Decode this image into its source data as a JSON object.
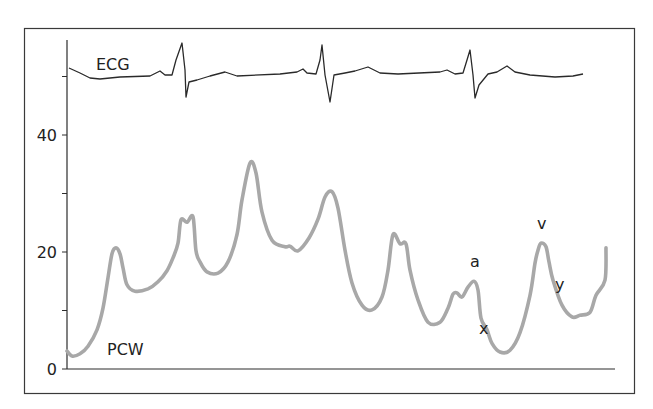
{
  "chart_data": {
    "type": "line",
    "title": "",
    "xlabel": "",
    "ylabel": "",
    "x_unit": "time sample index (no x-axis labels shown)",
    "ylim": [
      0,
      50
    ],
    "y_ticks": [
      {
        "value": 0,
        "label": "0"
      },
      {
        "value": 10,
        "label": ""
      },
      {
        "value": 20,
        "label": "20"
      },
      {
        "value": 30,
        "label": ""
      },
      {
        "value": 40,
        "label": "40"
      },
      {
        "value": 50,
        "label": ""
      }
    ],
    "grid": false,
    "legend": "none",
    "series": [
      {
        "name": "PCW",
        "label": "PCW",
        "color": "#a8a8a8",
        "x": [
          0,
          5,
          13,
          21,
          30,
          36,
          41,
          45,
          49,
          53,
          56,
          60,
          68,
          81,
          91,
          100,
          106,
          111,
          114,
          120,
          126,
          129,
          133,
          140,
          151,
          161,
          170,
          175,
          183,
          189,
          195,
          205,
          218,
          223,
          231,
          242,
          251,
          258,
          265,
          271,
          278,
          285,
          295,
          305,
          315,
          321,
          326,
          333,
          339,
          343,
          351,
          361,
          373,
          381,
          386,
          390,
          395,
          401,
          407,
          411,
          414,
          420,
          425,
          433,
          443,
          453,
          463,
          468,
          471,
          474,
          479,
          482,
          486,
          495,
          505,
          513,
          523,
          529,
          538,
          539
        ],
        "values": [
          3.1,
          2.2,
          2.6,
          3.9,
          6.7,
          10.4,
          15.6,
          19.7,
          20.7,
          19.7,
          17.3,
          14.4,
          13.3,
          13.7,
          14.9,
          16.8,
          19.0,
          21.5,
          25.5,
          25.1,
          26.0,
          20.2,
          18.3,
          16.6,
          16.4,
          18.3,
          23.0,
          28.9,
          35.2,
          33.5,
          26.8,
          22.0,
          20.9,
          21.0,
          20.2,
          22.4,
          25.6,
          29.4,
          30.3,
          27.5,
          20.3,
          14.7,
          10.9,
          10.1,
          12.3,
          16.9,
          23.0,
          21.4,
          21.4,
          16.9,
          11.8,
          8.0,
          8.0,
          10.4,
          12.8,
          13.0,
          12.3,
          14.0,
          15.0,
          13.5,
          8.7,
          6.7,
          4.4,
          2.9,
          3.2,
          6.2,
          12.6,
          18.1,
          20.3,
          21.5,
          20.9,
          18.3,
          15.2,
          10.9,
          8.9,
          9.2,
          9.7,
          12.6,
          15.2,
          20.7
        ]
      },
      {
        "name": "ECG",
        "label": "ECG",
        "color": "#2a2a2a",
        "amplitude_unit": "relative (arbitrary)",
        "x": [
          2,
          13,
          23,
          33,
          53,
          83,
          93,
          98,
          105,
          109,
          115,
          118,
          119,
          122,
          130,
          143,
          158,
          170,
          213,
          230,
          236,
          240,
          249,
          253,
          255,
          258,
          263,
          267,
          278,
          288,
          301,
          313,
          331,
          373,
          380,
          388,
          396,
          400,
          403,
          406,
          408,
          412,
          421,
          430,
          440,
          448,
          463,
          488,
          506,
          516
        ],
        "values": [
          0.8,
          -0.2,
          -1.2,
          -1.4,
          -1.0,
          -0.8,
          0.2,
          -0.6,
          -0.6,
          2.4,
          5.8,
          0.4,
          -5.0,
          -2.0,
          -1.6,
          -0.8,
          0.0,
          -0.8,
          -0.4,
          0.0,
          0.6,
          -0.2,
          -0.4,
          2.4,
          5.4,
          -0.6,
          -6.0,
          -0.6,
          -0.2,
          0.2,
          1.0,
          -0.2,
          -0.4,
          0.0,
          0.4,
          -0.4,
          -0.2,
          2.4,
          4.4,
          -0.6,
          -5.2,
          -2.6,
          -0.4,
          0.0,
          1.2,
          0.0,
          -0.6,
          -1.0,
          -0.8,
          -0.4
        ]
      }
    ],
    "annotations": [
      {
        "text": "a",
        "series": "PCW",
        "at_x": 407,
        "at_value": 15.0,
        "position": "above"
      },
      {
        "text": "x",
        "series": "PCW",
        "at_x": 414,
        "at_value": 8.7,
        "position": "left-below"
      },
      {
        "text": "v",
        "series": "PCW",
        "at_x": 474,
        "at_value": 21.5,
        "position": "above"
      },
      {
        "text": "y",
        "series": "PCW",
        "at_x": 486,
        "at_value": 15.2,
        "position": "right"
      }
    ]
  }
}
